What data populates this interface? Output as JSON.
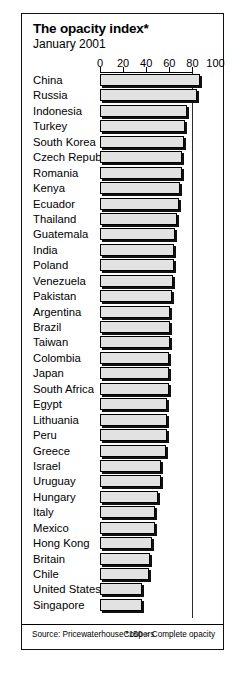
{
  "chart_data": {
    "type": "bar",
    "orientation": "horizontal",
    "title": "The opacity index*",
    "subtitle": "January 2001",
    "xlabel": "",
    "ylabel": "",
    "xlim": [
      0,
      100
    ],
    "ticks": [
      0,
      20,
      40,
      60,
      80,
      100
    ],
    "tick_labels": [
      "0",
      "20",
      "40",
      "60",
      "80",
      "100"
    ],
    "grid": "vertical-dotted",
    "gridlines": [
      40,
      60,
      80,
      100
    ],
    "legend": "none",
    "categories": [
      "China",
      "Russia",
      "Indonesia",
      "Turkey",
      "South Korea",
      "Czech Republic",
      "Romania",
      "Kenya",
      "Ecuador",
      "Thailand",
      "Guatemala",
      "India",
      "Poland",
      "Venezuela",
      "Pakistan",
      "Argentina",
      "Brazil",
      "Taiwan",
      "Colombia",
      "Japan",
      "South Africa",
      "Egypt",
      "Lithuania",
      "Peru",
      "Greece",
      "Israel",
      "Uruguay",
      "Hungary",
      "Italy",
      "Mexico",
      "Hong Kong",
      "Britain",
      "Chile",
      "United States",
      "Singapore"
    ],
    "values": [
      87,
      84,
      75,
      74,
      73,
      71,
      71,
      69,
      68,
      67,
      65,
      64,
      64,
      63,
      62,
      61,
      61,
      61,
      60,
      60,
      60,
      58,
      58,
      58,
      57,
      53,
      53,
      50,
      48,
      48,
      45,
      43,
      42,
      36,
      36
    ],
    "source_label": "Source: PricewaterhouseCoopers",
    "footnote": "*150 = Complete opacity"
  },
  "axis": {
    "tick_labels": [
      "0",
      "20",
      "40",
      "60",
      "80",
      "100"
    ]
  }
}
